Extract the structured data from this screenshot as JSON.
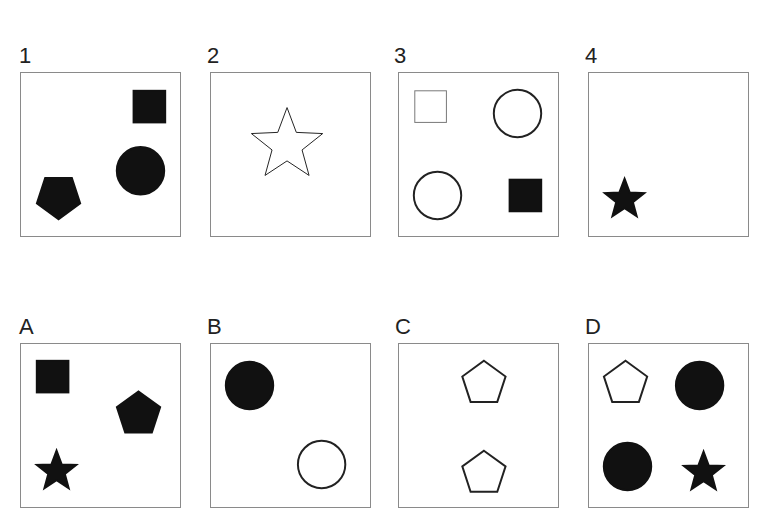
{
  "question_text_cropped": "",
  "question_panels": [
    {
      "label": "1",
      "shapes": [
        {
          "type": "square",
          "fill": "black",
          "cx": 130,
          "cy": 34
        },
        {
          "type": "circle",
          "fill": "black",
          "cx": 121,
          "cy": 99
        },
        {
          "type": "pentagon-inverted",
          "fill": "black",
          "cx": 38,
          "cy": 125
        }
      ]
    },
    {
      "label": "2",
      "shapes": [
        {
          "type": "star",
          "fill": "white",
          "cx": 77,
          "cy": 73,
          "size": "large"
        }
      ]
    },
    {
      "label": "3",
      "shapes": [
        {
          "type": "square",
          "fill": "white",
          "cx": 32,
          "cy": 34,
          "thin": true
        },
        {
          "type": "circle",
          "fill": "white",
          "cx": 120,
          "cy": 41
        },
        {
          "type": "circle",
          "fill": "white",
          "cx": 39,
          "cy": 124
        },
        {
          "type": "square",
          "fill": "black",
          "cx": 128,
          "cy": 124
        }
      ]
    },
    {
      "label": "4",
      "shapes": [
        {
          "type": "star",
          "fill": "black",
          "cx": 36,
          "cy": 128
        }
      ]
    }
  ],
  "answer_panels": [
    {
      "label": "A",
      "shapes": [
        {
          "type": "square",
          "fill": "black",
          "cx": 32,
          "cy": 33
        },
        {
          "type": "pentagon",
          "fill": "black",
          "cx": 119,
          "cy": 71
        },
        {
          "type": "star",
          "fill": "black",
          "cx": 36,
          "cy": 129
        }
      ]
    },
    {
      "label": "B",
      "shapes": [
        {
          "type": "circle",
          "fill": "black",
          "cx": 39,
          "cy": 42
        },
        {
          "type": "circle",
          "fill": "white",
          "cx": 112,
          "cy": 122
        }
      ]
    },
    {
      "label": "C",
      "shapes": [
        {
          "type": "pentagon",
          "fill": "white",
          "cx": 86,
          "cy": 40
        },
        {
          "type": "pentagon",
          "fill": "white",
          "cx": 86,
          "cy": 131
        }
      ]
    },
    {
      "label": "D",
      "shapes": [
        {
          "type": "pentagon",
          "fill": "white",
          "cx": 37,
          "cy": 40
        },
        {
          "type": "circle",
          "fill": "black",
          "cx": 112,
          "cy": 42
        },
        {
          "type": "circle",
          "fill": "black",
          "cx": 39,
          "cy": 124
        },
        {
          "type": "star",
          "fill": "black",
          "cx": 116,
          "cy": 130
        }
      ]
    }
  ]
}
